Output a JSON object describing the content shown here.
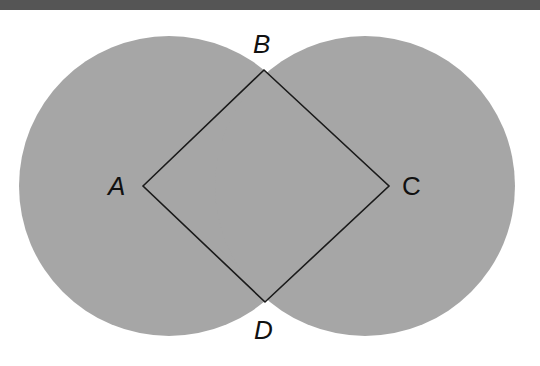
{
  "diagram": {
    "colors": {
      "circle_fill": "#a6a6a6",
      "line": "#1a1a1a",
      "topbar": "#555555",
      "background": "#ffffff"
    },
    "circles": [
      {
        "name": "left-circle",
        "cx": 169,
        "cy": 186,
        "r": 150
      },
      {
        "name": "right-circle",
        "cx": 365,
        "cy": 186,
        "r": 150
      }
    ],
    "square": {
      "points": "143,186 264,70 389,186 265,302"
    },
    "labels": {
      "A": "A",
      "B": "B",
      "C": "C",
      "D": "D"
    }
  }
}
